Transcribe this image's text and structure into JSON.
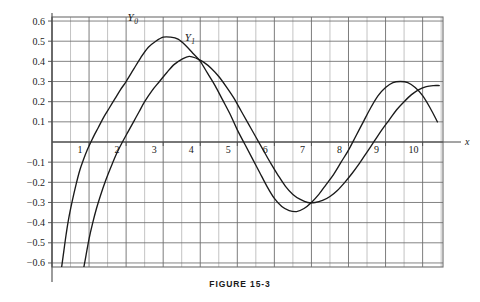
{
  "figure": {
    "caption": "FIGURE 15-3"
  },
  "chart_data": {
    "type": "line",
    "title": "",
    "subtitle": "",
    "xlabel": "x",
    "ylabel": "",
    "xlim": [
      0,
      10.55
    ],
    "ylim": [
      -0.62,
      0.62
    ],
    "grid": true,
    "grid_x_step": 0.5,
    "grid_y_step": 0.1,
    "legend_position": "inline-annotation",
    "xticks": [
      1,
      2,
      3,
      4,
      5,
      6,
      7,
      8,
      9,
      10
    ],
    "xtick_labels": [
      "1",
      "2",
      "3",
      "4",
      "5",
      "6",
      "7",
      "8",
      "9",
      "10"
    ],
    "yticks": [
      -0.6,
      -0.5,
      -0.4,
      -0.3,
      -0.2,
      -0.1,
      0.1,
      0.2,
      0.3,
      0.4,
      0.5,
      0.6
    ],
    "ytick_labels": [
      "−0.6",
      "−0.5",
      "−0.4",
      "−0.3",
      "−0.2",
      "−0.1",
      "0.1",
      "0.2",
      "0.3",
      "0.4",
      "0.5",
      "0.6"
    ],
    "annotations": [
      {
        "text": "Y",
        "sub": "0",
        "x": 2.18,
        "y": 0.6
      },
      {
        "text": "Y",
        "sub": "1",
        "x": 3.72,
        "y": 0.5
      }
    ],
    "series": [
      {
        "name": "Y0",
        "label": "Y₀",
        "color": "#1a1a1a",
        "x": [
          0.26,
          0.32,
          0.38,
          0.45,
          0.55,
          0.65,
          0.75,
          0.85,
          0.95,
          1.05,
          1.15,
          1.25,
          1.4,
          1.55,
          1.7,
          1.85,
          2.0,
          2.2,
          2.4,
          2.6,
          2.8,
          3.0,
          3.2,
          3.4,
          3.6,
          3.8,
          4.0,
          4.2,
          4.4,
          4.6,
          4.8,
          5.0,
          5.2,
          5.4,
          5.6,
          5.8,
          6.0,
          6.2,
          6.4,
          6.6,
          6.8,
          7.0,
          7.2,
          7.4,
          7.6,
          7.8,
          8.0,
          8.2,
          8.4,
          8.6,
          8.8,
          9.0,
          9.2,
          9.4,
          9.6,
          9.8,
          10.0,
          10.2,
          10.4
        ],
        "y": [
          -0.62,
          -0.54,
          -0.46,
          -0.38,
          -0.29,
          -0.21,
          -0.14,
          -0.087,
          -0.04,
          0.0,
          0.038,
          0.072,
          0.125,
          0.17,
          0.215,
          0.26,
          0.3,
          0.36,
          0.42,
          0.47,
          0.5,
          0.52,
          0.52,
          0.51,
          0.48,
          0.44,
          0.4,
          0.34,
          0.28,
          0.21,
          0.14,
          0.06,
          -0.01,
          -0.08,
          -0.15,
          -0.22,
          -0.28,
          -0.32,
          -0.34,
          -0.345,
          -0.33,
          -0.3,
          -0.26,
          -0.21,
          -0.16,
          -0.1,
          -0.04,
          0.03,
          0.1,
          0.17,
          0.23,
          0.27,
          0.295,
          0.3,
          0.295,
          0.27,
          0.23,
          0.17,
          0.1
        ],
        "key_points": {
          "first_zero": 0.894,
          "first_max": {
            "x": 2.2,
            "y": 0.52
          },
          "second_zero": 5.14,
          "first_min": {
            "x": 5.5,
            "y": -0.345
          },
          "third_zero": 8.0,
          "second_max": {
            "x": 8.6,
            "y": 0.3
          },
          "end_value_at_10": 0.056
        }
      },
      {
        "name": "Y1",
        "label": "Y₁",
        "color": "#1a1a1a",
        "x": [
          0.86,
          0.92,
          1.0,
          1.1,
          1.2,
          1.3,
          1.45,
          1.6,
          1.75,
          1.9,
          2.05,
          2.2,
          2.35,
          2.5,
          2.7,
          2.9,
          3.1,
          3.3,
          3.5,
          3.7,
          3.9,
          4.1,
          4.3,
          4.5,
          4.7,
          4.9,
          5.1,
          5.3,
          5.5,
          5.7,
          5.9,
          6.1,
          6.3,
          6.5,
          6.7,
          6.9,
          7.1,
          7.3,
          7.5,
          7.7,
          7.9,
          8.1,
          8.3,
          8.5,
          8.7,
          8.9,
          9.1,
          9.3,
          9.5,
          9.7,
          9.9,
          10.1,
          10.3,
          10.45
        ],
        "y": [
          -0.62,
          -0.56,
          -0.48,
          -0.4,
          -0.33,
          -0.27,
          -0.19,
          -0.12,
          -0.055,
          0.0,
          0.05,
          0.1,
          0.15,
          0.2,
          0.255,
          0.3,
          0.345,
          0.385,
          0.41,
          0.425,
          0.415,
          0.395,
          0.365,
          0.325,
          0.275,
          0.22,
          0.155,
          0.09,
          0.025,
          -0.04,
          -0.105,
          -0.165,
          -0.22,
          -0.26,
          -0.285,
          -0.3,
          -0.3,
          -0.29,
          -0.27,
          -0.24,
          -0.2,
          -0.155,
          -0.105,
          -0.05,
          0.005,
          0.06,
          0.11,
          0.16,
          0.2,
          0.235,
          0.26,
          0.275,
          0.28,
          0.28
        ],
        "key_points": {
          "first_zero": 2.197,
          "first_max": {
            "x": 3.68,
            "y": 0.425
          },
          "second_zero": 5.43,
          "first_min": {
            "x": 7.0,
            "y": -0.3
          },
          "third_zero": 8.6,
          "end_value_at_10": 0.249
        }
      }
    ],
    "colors": {
      "curve": "#1a1a1a",
      "grid": "#6e6e6e",
      "grid_light": "#9a9a9a",
      "axis": "#4a4a4a",
      "background": "#ffffff"
    }
  }
}
